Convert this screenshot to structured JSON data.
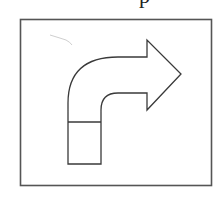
{
  "figure": {
    "cutoff_text": "p",
    "colors": {
      "stroke": "#3a3a3a",
      "frame": "#555555",
      "background": "#ffffff",
      "pencil_mark": "#c8c8c8"
    },
    "frame": {
      "x": 20,
      "y": 19,
      "width": 191,
      "height": 166
    },
    "arrow": {
      "direction": "right",
      "stem_bottom_box": {
        "x": 68,
        "y": 122,
        "width": 33,
        "height": 42
      },
      "head": {
        "base_x": 147,
        "top_y": 40,
        "bottom_y": 110,
        "tip_x": 181,
        "tip_y": 74
      }
    }
  }
}
